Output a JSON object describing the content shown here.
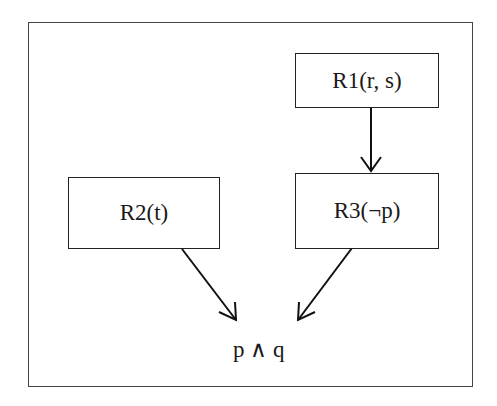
{
  "diagram": {
    "nodes": [
      {
        "id": "r1",
        "label": "R1(r, s)"
      },
      {
        "id": "r2",
        "label": "R2(t)"
      },
      {
        "id": "r3",
        "label": "R3(¬p)"
      }
    ],
    "target": {
      "label": "p ∧ q"
    },
    "edges": [
      {
        "from": "r1",
        "to": "r3"
      },
      {
        "from": "r2",
        "to": "target"
      },
      {
        "from": "r3",
        "to": "target"
      }
    ]
  }
}
